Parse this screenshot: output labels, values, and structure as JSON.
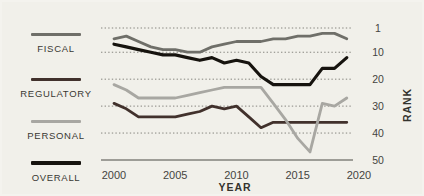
{
  "chart_data": {
    "type": "line",
    "title": "",
    "xlabel": "YEAR",
    "ylabel": "RANK",
    "x_axis": {
      "ticks": [
        "2000",
        "2005",
        "2010",
        "2015",
        "2020"
      ],
      "tick_values": [
        2000,
        2005,
        2010,
        2015,
        2020
      ]
    },
    "y_axis": {
      "label": "RANK",
      "side": "right",
      "inverted": true,
      "range": [
        1,
        50
      ],
      "ticks": [
        "1",
        "10",
        "20",
        "30",
        "40",
        "50"
      ],
      "tick_values": [
        1,
        10,
        20,
        30,
        40,
        50
      ],
      "gridlines": "dotted"
    },
    "years": [
      2000,
      2001,
      2002,
      2003,
      2004,
      2005,
      2006,
      2007,
      2008,
      2009,
      2010,
      2011,
      2012,
      2013,
      2014,
      2015,
      2016,
      2017,
      2018,
      2019
    ],
    "series": [
      {
        "name": "FISCAL",
        "color": "#6f6f69",
        "values": [
          5,
          4,
          6,
          8,
          9,
          9,
          10,
          10,
          8,
          7,
          6,
          6,
          6,
          5,
          5,
          4,
          4,
          3,
          3,
          5
        ]
      },
      {
        "name": "REGULATORY",
        "color": "#41312c",
        "values": [
          29,
          31,
          34,
          34,
          34,
          34,
          33,
          32,
          30,
          31,
          30,
          34,
          38,
          36,
          36,
          36,
          36,
          36,
          36,
          36
        ]
      },
      {
        "name": "PERSONAL",
        "color": "#a8a7a2",
        "values": [
          22,
          24,
          27,
          27,
          27,
          27,
          26,
          25,
          24,
          23,
          23,
          23,
          23,
          29,
          35,
          42,
          47,
          29,
          30,
          27
        ]
      },
      {
        "name": "OVERALL",
        "color": "#16130e",
        "values": [
          7,
          8,
          9,
          10,
          11,
          11,
          12,
          13,
          12,
          14,
          13,
          14,
          19,
          22,
          22,
          22,
          22,
          16,
          16,
          12
        ]
      }
    ],
    "colors": {
      "grid": "#86857f",
      "baseline": "#4a4a45",
      "tick_text": "#45443f"
    }
  },
  "legend": {
    "items": [
      {
        "label": "FISCAL"
      },
      {
        "label": "REGULATORY"
      },
      {
        "label": "PERSONAL"
      },
      {
        "label": "OVERALL"
      }
    ]
  }
}
